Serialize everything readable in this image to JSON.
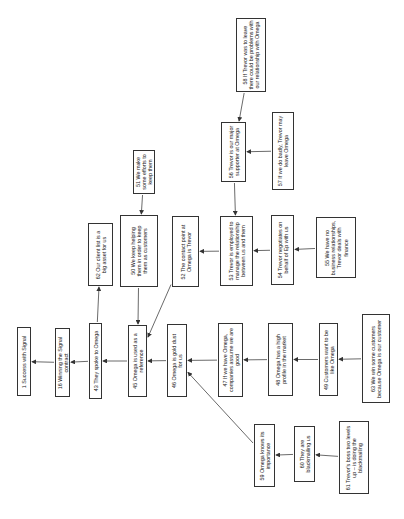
{
  "diagram": {
    "type": "cognitive-map",
    "orientation": "rotated-90-ccw",
    "nodes": [
      {
        "id": "1",
        "label": "1 Success with Signal",
        "x": 17,
        "y": 327,
        "w": 14,
        "h": 69,
        "tw": 66
      },
      {
        "id": "16",
        "label": "16 Winning the Signal contract",
        "x": 55,
        "y": 328,
        "w": 15,
        "h": 69,
        "tw": 60
      },
      {
        "id": "43",
        "label": "43 They spoke to Omega",
        "x": 89,
        "y": 323,
        "w": 13,
        "h": 76,
        "tw": 74
      },
      {
        "id": "62",
        "label": "62 Our client list is a big asset for us",
        "x": 88,
        "y": 223,
        "w": 25,
        "h": 63,
        "tw": 56
      },
      {
        "id": "45",
        "label": "45 Omega is used as a reference",
        "x": 128,
        "y": 325,
        "w": 19,
        "h": 72,
        "tw": 66
      },
      {
        "id": "50",
        "label": "50 We keep helping them in order to keep them as customers",
        "x": 120,
        "y": 215,
        "w": 38,
        "h": 72,
        "tw": 60
      },
      {
        "id": "51",
        "label": "51 We make some efforts to keep them",
        "x": 133,
        "y": 150,
        "w": 22,
        "h": 44,
        "tw": 42
      },
      {
        "id": "52",
        "label": "52 The contact point at Omega is Trevor",
        "x": 172,
        "y": 216,
        "w": 27,
        "h": 71,
        "tw": 56
      },
      {
        "id": "46",
        "label": "46 Omega is gold dust for us",
        "x": 167,
        "y": 324,
        "w": 20,
        "h": 73,
        "tw": 60
      },
      {
        "id": "47",
        "label": "47 If we have Omega, companies assume we are good",
        "x": 218,
        "y": 323,
        "w": 25,
        "h": 74,
        "tw": 68
      },
      {
        "id": "53",
        "label": "53 Trevor is employed to manage the relationship between us and them",
        "x": 220,
        "y": 216,
        "w": 33,
        "h": 70,
        "tw": 68
      },
      {
        "id": "56",
        "label": "56 Trevor is our major supporter at Omega",
        "x": 221,
        "y": 122,
        "w": 25,
        "h": 60,
        "tw": 56
      },
      {
        "id": "57",
        "label": "57 If we do badly, Trevor may leave Omega",
        "x": 272,
        "y": 112,
        "w": 22,
        "h": 78,
        "tw": 74
      },
      {
        "id": "58",
        "label": "58 If Trevor was to leave there could be problems with our relationship with Omega",
        "x": 236,
        "y": 18,
        "w": 30,
        "h": 74,
        "tw": 72
      },
      {
        "id": "54",
        "label": "54 Trevor negotiates on behalf of Ep with us",
        "x": 271,
        "y": 215,
        "w": 23,
        "h": 70,
        "tw": 66
      },
      {
        "id": "55",
        "label": "55 We have no business relationships, Trevor deals with finance",
        "x": 316,
        "y": 217,
        "w": 40,
        "h": 61,
        "tw": 56
      },
      {
        "id": "48",
        "label": "48 Omega has a high profile in the market",
        "x": 268,
        "y": 323,
        "w": 25,
        "h": 73,
        "tw": 60
      },
      {
        "id": "49",
        "label": "49 Customers want to be like Omega",
        "x": 319,
        "y": 323,
        "w": 19,
        "h": 73,
        "tw": 68
      },
      {
        "id": "63",
        "label": "63 We win some customers because Omega is our customer",
        "x": 362,
        "y": 314,
        "w": 28,
        "h": 89,
        "tw": 80
      },
      {
        "id": "59",
        "label": "59 Omega knows its importance",
        "x": 254,
        "y": 424,
        "w": 21,
        "h": 63,
        "tw": 60
      },
      {
        "id": "60",
        "label": "60 They are blackmailing us",
        "x": 294,
        "y": 426,
        "w": 21,
        "h": 56,
        "tw": 50
      },
      {
        "id": "61",
        "label": "61 Trevor's boss two levels up – is doing the blackmailing",
        "x": 339,
        "y": 421,
        "w": 30,
        "h": 73,
        "tw": 68
      }
    ],
    "edges": [
      {
        "from": "16",
        "to": "1"
      },
      {
        "from": "43",
        "to": "16"
      },
      {
        "from": "45",
        "to": "43"
      },
      {
        "from": "43",
        "to": "62"
      },
      {
        "from": "50",
        "to": "45"
      },
      {
        "from": "52",
        "to": "45"
      },
      {
        "from": "51",
        "to": "50"
      },
      {
        "from": "46",
        "to": "45"
      },
      {
        "from": "47",
        "to": "46"
      },
      {
        "from": "48",
        "to": "47"
      },
      {
        "from": "49",
        "to": "48"
      },
      {
        "from": "63",
        "to": "49"
      },
      {
        "from": "53",
        "to": "52"
      },
      {
        "from": "54",
        "to": "53"
      },
      {
        "from": "55",
        "to": "54"
      },
      {
        "from": "56",
        "to": "53"
      },
      {
        "from": "57",
        "to": "56"
      },
      {
        "from": "58",
        "to": "56"
      },
      {
        "from": "59",
        "to": "46"
      },
      {
        "from": "60",
        "to": "59"
      },
      {
        "from": "61",
        "to": "60"
      }
    ],
    "colors": {
      "border": "#333333",
      "text": "#222222",
      "line": "#444444",
      "background": "#ffffff"
    }
  }
}
